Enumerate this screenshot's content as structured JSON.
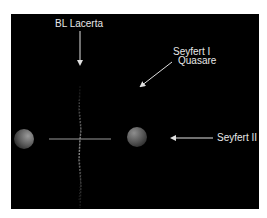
{
  "diagram": {
    "title": "",
    "background": "#000000",
    "label_color": "#e8e8e8",
    "labels": {
      "bl_lacerta": "BL Lacerta",
      "seyfert_1": "Seyfert I",
      "quasare": "Quasare",
      "seyfert_2": "Seyfert II"
    },
    "elements": [
      {
        "name": "left-torus-sphere",
        "type": "sphere",
        "cx": 24,
        "cy": 139,
        "r": 10
      },
      {
        "name": "right-torus-sphere",
        "type": "sphere",
        "cx": 137,
        "cy": 137,
        "r": 10
      },
      {
        "name": "accretion-disk",
        "type": "line",
        "x1": 49,
        "y1": 139,
        "x2": 111,
        "y2": 139
      },
      {
        "name": "jet",
        "type": "line",
        "x1": 80,
        "y1": 86,
        "x2": 80,
        "y2": 208
      }
    ],
    "arrows": [
      {
        "name": "arrow-bl-lacerta",
        "from": [
          80,
          31
        ],
        "to": [
          80,
          66
        ],
        "points_to": "jet (viewed along axis)"
      },
      {
        "name": "arrow-seyfert-1-quasare",
        "from": [
          172,
          62
        ],
        "to": [
          139,
          88
        ],
        "points_to": "oblique view"
      },
      {
        "name": "arrow-seyfert-2",
        "from": [
          213,
          138
        ],
        "to": [
          170,
          138
        ],
        "points_to": "edge-on view"
      }
    ]
  }
}
